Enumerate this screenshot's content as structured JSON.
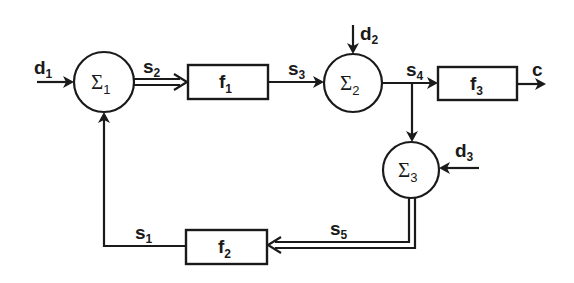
{
  "diagram": {
    "type": "block-diagram",
    "summing_junctions": [
      {
        "id": "sum1",
        "symbol": "Σ",
        "index": "1"
      },
      {
        "id": "sum2",
        "symbol": "Σ",
        "index": "2"
      },
      {
        "id": "sum3",
        "symbol": "Σ",
        "index": "3"
      }
    ],
    "blocks": [
      {
        "id": "f1",
        "name": "f",
        "index": "1"
      },
      {
        "id": "f2",
        "name": "f",
        "index": "2"
      },
      {
        "id": "f3",
        "name": "f",
        "index": "3"
      }
    ],
    "signals": {
      "d1": {
        "name": "d",
        "index": "1"
      },
      "d2": {
        "name": "d",
        "index": "2"
      },
      "d3": {
        "name": "d",
        "index": "3"
      },
      "s1": {
        "name": "s",
        "index": "1"
      },
      "s2": {
        "name": "s",
        "index": "2"
      },
      "s3": {
        "name": "s",
        "index": "3"
      },
      "s4": {
        "name": "s",
        "index": "4"
      },
      "s5": {
        "name": "s",
        "index": "5"
      },
      "c": {
        "name": "c"
      }
    },
    "connections": [
      {
        "from": "d1",
        "to": "sum1",
        "style": "single"
      },
      {
        "from": "sum1",
        "to": "f1",
        "signal": "s2",
        "style": "double"
      },
      {
        "from": "f1",
        "to": "sum2",
        "signal": "s3",
        "style": "single"
      },
      {
        "from": "d2",
        "to": "sum2",
        "style": "single"
      },
      {
        "from": "sum2",
        "to": "f3",
        "signal": "s4",
        "style": "single"
      },
      {
        "from": "f3",
        "to": "output",
        "signal": "c",
        "style": "single"
      },
      {
        "from": "s4-branch",
        "to": "sum3",
        "style": "single"
      },
      {
        "from": "d3",
        "to": "sum3",
        "style": "single"
      },
      {
        "from": "sum3",
        "to": "f2",
        "signal": "s5",
        "style": "double"
      },
      {
        "from": "f2",
        "to": "sum1",
        "signal": "s1",
        "style": "single"
      }
    ]
  }
}
